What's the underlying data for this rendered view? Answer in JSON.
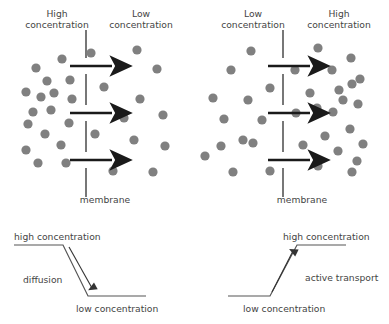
{
  "figure": {
    "colors": {
      "particle": "#808080",
      "membrane": "#555555",
      "arrow": "#1a1a1a",
      "text": "#444444",
      "graph_line": "#555555",
      "background": "#ffffff"
    }
  },
  "panels": [
    {
      "id": "diffusion-panel",
      "left_label_line1": "High",
      "left_label_line2": "concentration",
      "right_label_line1": "Low",
      "right_label_line2": "concentration",
      "membrane_label": "membrane",
      "arrow_count": 3,
      "arrow_direction": "right",
      "dense_side": "left",
      "particles_left_count": 17,
      "particles_right_count": 12
    },
    {
      "id": "active-transport-panel",
      "left_label_line1": "Low",
      "left_label_line2": "concentration",
      "right_label_line1": "High",
      "right_label_line2": "concentration",
      "membrane_label": "membrane",
      "arrow_count": 3,
      "arrow_direction": "right",
      "dense_side": "right",
      "particles_left_count": 13,
      "particles_right_count": 21
    }
  ],
  "graphs": [
    {
      "id": "diffusion-graph",
      "process_label": "diffusion",
      "start_label": "high concentration",
      "end_label": "low concentration",
      "direction": "downhill",
      "arrow_direction": "down-right"
    },
    {
      "id": "active-transport-graph",
      "process_label": "active transport",
      "start_label": "low concentration",
      "end_label": "high concentration",
      "direction": "uphill",
      "arrow_direction": "up-right"
    }
  ],
  "particles": {
    "panel1_left": [
      [
        36,
        68
      ],
      [
        62,
        59
      ],
      [
        47,
        81
      ],
      [
        26,
        92
      ],
      [
        41,
        97
      ],
      [
        70,
        80
      ],
      [
        33,
        112
      ],
      [
        51,
        110
      ],
      [
        28,
        124
      ],
      [
        45,
        134
      ],
      [
        26,
        150
      ],
      [
        38,
        163
      ],
      [
        61,
        145
      ],
      [
        69,
        123
      ],
      [
        66,
        163
      ],
      [
        72,
        99
      ],
      [
        54,
        93
      ]
    ],
    "panel1_right": [
      [
        104,
        55
      ],
      [
        123,
        72
      ],
      [
        105,
        99
      ],
      [
        137,
        101
      ],
      [
        97,
        123
      ],
      [
        124,
        138
      ],
      [
        156,
        116
      ],
      [
        162,
        74
      ],
      [
        146,
        167
      ],
      [
        119,
        170
      ],
      [
        164,
        146
      ],
      [
        91,
        53
      ]
    ],
    "panel2_left": [
      [
        230,
        56
      ],
      [
        214,
        68
      ],
      [
        240,
        62
      ],
      [
        251,
        95
      ],
      [
        227,
        103
      ],
      [
        205,
        116
      ],
      [
        239,
        125
      ],
      [
        244,
        75
      ],
      [
        211,
        145
      ],
      [
        232,
        140
      ],
      [
        251,
        170
      ],
      [
        216,
        170
      ],
      [
        259,
        119
      ]
    ],
    "panel2_right": [
      [
        318,
        57
      ],
      [
        352,
        61
      ],
      [
        333,
        75
      ],
      [
        318,
        87
      ],
      [
        351,
        88
      ],
      [
        339,
        100
      ],
      [
        309,
        93
      ],
      [
        318,
        110
      ],
      [
        325,
        113
      ],
      [
        348,
        117
      ],
      [
        360,
        108
      ],
      [
        312,
        130
      ],
      [
        330,
        134
      ],
      [
        348,
        146
      ],
      [
        316,
        158
      ],
      [
        340,
        160
      ],
      [
        362,
        140
      ],
      [
        353,
        170
      ],
      [
        324,
        170
      ],
      [
        300,
        167
      ],
      [
        306,
        120
      ]
    ]
  },
  "membrane": {
    "panel1_x": 86,
    "panel2_x": 283,
    "dash_segments": 4,
    "top_y": 28,
    "bottom_y": 190
  },
  "transport_arrows": {
    "panel1": [
      [
        70,
        66,
        117,
        66
      ],
      [
        70,
        113,
        117,
        113
      ],
      [
        70,
        160,
        117,
        160
      ]
    ],
    "panel2": [
      [
        266,
        66,
        313,
        66
      ],
      [
        266,
        113,
        313,
        113
      ],
      [
        266,
        160,
        313,
        160
      ]
    ]
  }
}
